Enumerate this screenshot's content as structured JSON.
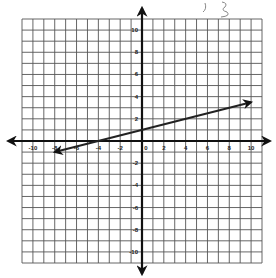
{
  "chart_data": {
    "type": "line",
    "title": "",
    "xlabel": "",
    "ylabel": "",
    "xlim": [
      -11,
      11
    ],
    "ylim": [
      -11,
      11
    ],
    "grid": true,
    "x_ticks": [
      -10,
      -8,
      -6,
      -4,
      -2,
      0,
      2,
      4,
      6,
      8,
      10
    ],
    "y_ticks": [
      -10,
      -8,
      -6,
      -4,
      -2,
      2,
      4,
      6,
      8,
      10
    ],
    "series": [
      {
        "name": "line",
        "equation": "y = 0.25x + 1",
        "x": [
          -8,
          10
        ],
        "y": [
          -1,
          3.5
        ],
        "arrows": "both"
      }
    ],
    "annotation": "handwritten scribble at top (illegible)"
  },
  "colors": {
    "grid": "#555555",
    "axis": "#111111",
    "line": "#222222",
    "background": "#ffffff"
  }
}
